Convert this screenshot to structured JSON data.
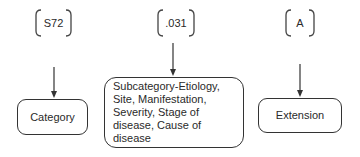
{
  "diagram": {
    "codes": [
      {
        "id": "category-code",
        "text": "S72"
      },
      {
        "id": "subcategory-code",
        "text": ".031"
      },
      {
        "id": "extension-code",
        "text": "A"
      }
    ],
    "boxes": [
      {
        "id": "category",
        "label": "Category"
      },
      {
        "id": "subcategory",
        "label": "Subcategory-Etiology, Site, Manifestation, Severity, Stage of disease, Cause of disease"
      },
      {
        "id": "extension",
        "label": "Extension"
      }
    ],
    "colors": {
      "stroke": "#333333",
      "text": "#2a2a2a",
      "background": "#ffffff"
    }
  }
}
